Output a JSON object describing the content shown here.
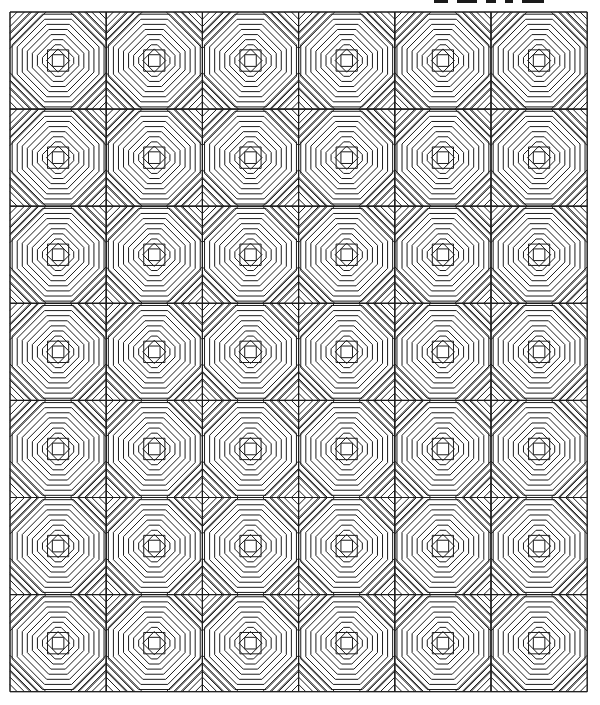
{
  "page": {
    "background": "#ffffff",
    "line_color": "#1c1c1c",
    "top_text_cropped": true
  },
  "quilt": {
    "pattern": "pineapple",
    "columns": 6,
    "rows": 7,
    "origin_x": 10,
    "origin_y": 12,
    "block_width": 96.2,
    "block_height": 97.1,
    "stroke_width": 1
  }
}
